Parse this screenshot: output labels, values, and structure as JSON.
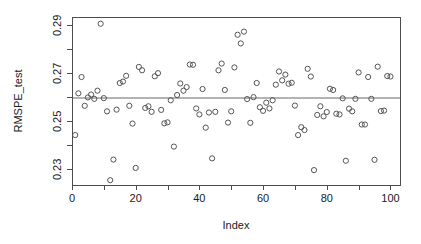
{
  "chart_data": {
    "type": "scatter",
    "title": "",
    "xlabel": "Index",
    "ylabel": "RMSPE_test",
    "xlim": [
      0,
      103
    ],
    "ylim": [
      0.2235,
      0.2935
    ],
    "grid": false,
    "legend": null,
    "x_ticks": [
      0,
      20,
      40,
      60,
      80,
      100
    ],
    "x_tick_labels": [
      "0",
      "20",
      "40",
      "60",
      "80",
      "100"
    ],
    "x_minor_ticks": [
      10,
      30,
      50,
      70,
      90
    ],
    "y_ticks": [
      0.23,
      0.25,
      0.27,
      0.29
    ],
    "y_tick_labels": [
      "0.23",
      "0.25",
      "0.27",
      "0.29"
    ],
    "y_minor_ticks": [
      0.24,
      0.26,
      0.28
    ],
    "point_symbol": "open-circle",
    "point_color": "#555555",
    "reference_line": {
      "orientation": "horizontal",
      "value": 0.2598,
      "color": "#b3b3b3",
      "width": 2
    },
    "x": [
      1,
      2,
      3,
      4,
      5,
      6,
      7,
      8,
      9,
      10,
      11,
      12,
      13,
      14,
      15,
      16,
      17,
      18,
      19,
      20,
      21,
      22,
      23,
      24,
      25,
      26,
      27,
      28,
      29,
      30,
      31,
      32,
      33,
      34,
      35,
      36,
      37,
      38,
      39,
      40,
      41,
      42,
      43,
      44,
      45,
      46,
      47,
      48,
      49,
      50,
      51,
      52,
      53,
      54,
      55,
      56,
      57,
      58,
      59,
      60,
      61,
      62,
      63,
      64,
      65,
      66,
      67,
      68,
      69,
      70,
      71,
      72,
      73,
      74,
      75,
      76,
      77,
      78,
      79,
      80,
      81,
      82,
      83,
      84,
      85,
      86,
      87,
      88,
      89,
      90,
      91,
      92,
      93,
      94,
      95,
      96,
      97,
      98,
      99,
      100
    ],
    "y": [
      0.2443,
      0.2617,
      0.2685,
      0.2565,
      0.26,
      0.2612,
      0.2594,
      0.2628,
      0.2907,
      0.2597,
      0.2542,
      0.2255,
      0.2341,
      0.2549,
      0.266,
      0.2666,
      0.269,
      0.2565,
      0.2491,
      0.2306,
      0.2727,
      0.2713,
      0.2556,
      0.2563,
      0.254,
      0.2688,
      0.2701,
      0.2548,
      0.2492,
      0.2496,
      0.2588,
      0.2395,
      0.261,
      0.2658,
      0.2628,
      0.2643,
      0.2737,
      0.2736,
      0.2554,
      0.2529,
      0.2635,
      0.2474,
      0.2537,
      0.2346,
      0.254,
      0.2713,
      0.2741,
      0.2631,
      0.2495,
      0.2542,
      0.2725,
      0.2861,
      0.2825,
      0.2874,
      0.2593,
      0.2494,
      0.2601,
      0.266,
      0.2559,
      0.2544,
      0.2578,
      0.2554,
      0.2588,
      0.2653,
      0.2708,
      0.2671,
      0.2695,
      0.2657,
      0.2661,
      0.2566,
      0.2443,
      0.2476,
      0.2464,
      0.2719,
      0.2687,
      0.2297,
      0.2527,
      0.2563,
      0.2521,
      0.2539,
      0.2636,
      0.2631,
      0.2532,
      0.2529,
      0.2596,
      0.2336,
      0.2553,
      0.2542,
      0.2594,
      0.2704,
      0.2487,
      0.2487,
      0.2685,
      0.2594,
      0.234,
      0.2728,
      0.2543,
      0.2545,
      0.2689,
      0.2687
    ]
  },
  "geometry": {
    "plot_left": 72,
    "plot_right": 400,
    "plot_top": 17,
    "plot_bottom": 185
  }
}
